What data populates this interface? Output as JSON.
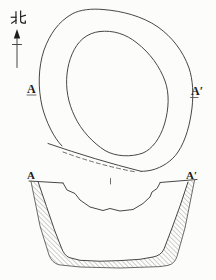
{
  "figure": {
    "north": {
      "label": "北"
    },
    "plan": {
      "section_marker_left": "A",
      "section_marker_right": "A′"
    },
    "section": {
      "marker_left": "A",
      "marker_right": "A′"
    }
  },
  "colors": {
    "background": "#fcfcfa",
    "line": "#474747",
    "hatch": "#7d7d7d",
    "text": "#1d1d1d"
  }
}
